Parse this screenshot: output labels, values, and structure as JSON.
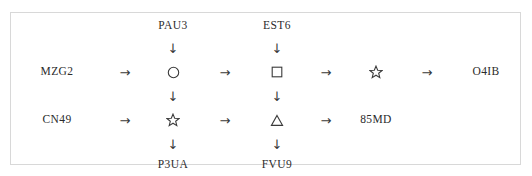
{
  "diagram": {
    "type": "flow-diagram",
    "border_color": "#d8d8d8",
    "text_color": "#2b2b2b",
    "arrow_color": "#3a3a3a",
    "background": "#ffffff",
    "arrows": {
      "right": "→",
      "down": "↓"
    },
    "nodes": {
      "top_left_label": "PAU3",
      "top_right_label": "EST6",
      "row1_start_label": "MZG2",
      "row1_end_label": "O4IB",
      "row2_start_label": "CN49",
      "row2_end_label": "85MD",
      "bottom_left_label": "P3UA",
      "bottom_right_label": "FVU9"
    },
    "shapes": {
      "row1_col3": "circle",
      "row1_col5": "square",
      "row1_col7": "star",
      "row2_col3": "star",
      "row2_col5": "triangle"
    },
    "flow_rows": [
      {
        "id": "row-1",
        "sequence": [
          "MZG2",
          "→",
          "circle",
          "→",
          "square",
          "→",
          "star",
          "→",
          "O4IB"
        ]
      },
      {
        "id": "row-2",
        "sequence": [
          "CN49",
          "→",
          "star",
          "→",
          "triangle",
          "→",
          "85MD"
        ]
      }
    ],
    "vertical_links": [
      {
        "from": "PAU3",
        "to": "circle",
        "glyph": "↓"
      },
      {
        "from": "EST6",
        "to": "square",
        "glyph": "↓"
      },
      {
        "from": "circle",
        "to": "star",
        "glyph": "↓"
      },
      {
        "from": "square",
        "to": "triangle",
        "glyph": "↓"
      },
      {
        "from": "star",
        "to": "P3UA",
        "glyph": "↓"
      },
      {
        "from": "triangle",
        "to": "FVU9",
        "glyph": "↓"
      }
    ]
  }
}
